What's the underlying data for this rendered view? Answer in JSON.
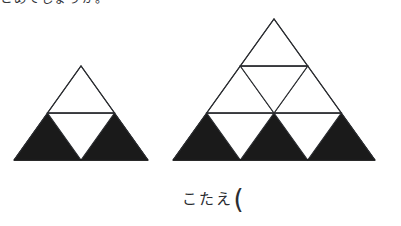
{
  "page": {
    "background_color": "#ffffff",
    "ink_color": "#1a1a1a",
    "outline_color": "#2b2d31",
    "width": 401,
    "height": 226
  },
  "prompt": {
    "text": "とめてしょうか。",
    "note": "clipped at top edge of image"
  },
  "answer": {
    "label": "こたえ",
    "open_paren": "("
  },
  "figures": [
    {
      "id": "figure-left",
      "name": "sierpinski-order-1",
      "rows": 2,
      "apex": {
        "x": 81,
        "y": 66
      },
      "base_left": {
        "x": 14,
        "y": 160
      },
      "base_right": {
        "x": 148,
        "y": 160
      },
      "filled_count": 2,
      "outlined_count": 2,
      "divider_y": 113
    },
    {
      "id": "figure-right",
      "name": "sierpinski-order-2",
      "rows": 3,
      "apex": {
        "x": 274,
        "y": 19
      },
      "base_left": {
        "x": 173,
        "y": 160
      },
      "base_right": {
        "x": 375,
        "y": 160
      },
      "filled_count": 3,
      "outlined_count": 6,
      "divider_y_top": 66,
      "divider_y_bottom": 113
    }
  ]
}
